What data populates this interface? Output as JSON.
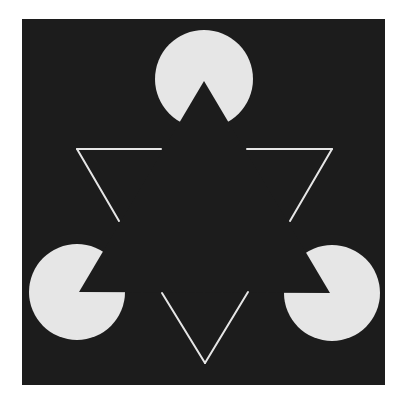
{
  "figure": {
    "title": "Kanizsa triangle illusion",
    "canvas": {
      "width": 404,
      "height": 396,
      "background": "#ffffff"
    },
    "panel": {
      "x": 22,
      "y": 19,
      "width": 363,
      "height": 366,
      "fill": "#1c1c1c"
    },
    "colors": {
      "figure": "#e6e6e6",
      "background": "#1c1c1c"
    },
    "implied_triangle": {
      "vertices": [
        [
          204,
          80
        ],
        [
          331,
          292
        ],
        [
          78,
          292
        ]
      ],
      "apex_top": [
        204,
        81
      ],
      "apex_right": [
        330,
        293
      ],
      "apex_left": [
        79,
        292
      ]
    },
    "pacmen": [
      {
        "name": "top",
        "cx": 204,
        "cy": 79,
        "r": 49
      },
      {
        "name": "bottom-left",
        "cx": 77,
        "cy": 292,
        "r": 48
      },
      {
        "name": "bottom-right",
        "cx": 332,
        "cy": 293,
        "r": 48
      }
    ],
    "outline_triangle": {
      "vertices": [
        [
          77,
          149
        ],
        [
          332,
          149
        ],
        [
          205,
          363
        ]
      ],
      "stroke_width": 2,
      "segments": [
        {
          "name": "top-left-horizontal",
          "from": [
            77,
            149
          ],
          "to": [
            161,
            149
          ]
        },
        {
          "name": "left-diagonal",
          "from": [
            77,
            149
          ],
          "to": [
            119,
            221
          ]
        },
        {
          "name": "top-right-horizontal",
          "from": [
            247,
            149
          ],
          "to": [
            332,
            149
          ]
        },
        {
          "name": "right-diagonal",
          "from": [
            332,
            149
          ],
          "to": [
            290,
            221
          ]
        },
        {
          "name": "bottom-left-arm",
          "from": [
            162,
            293
          ],
          "to": [
            205,
            363
          ]
        },
        {
          "name": "bottom-right-arm",
          "from": [
            248,
            292
          ],
          "to": [
            205,
            363
          ]
        }
      ]
    }
  }
}
